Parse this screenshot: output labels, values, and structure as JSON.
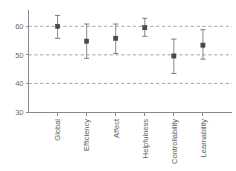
{
  "chart_data": {
    "type": "scatter",
    "title": "",
    "subtitle": "",
    "xlabel": "",
    "ylabel": "",
    "categories": [
      "Global",
      "Efficiency",
      "Affect",
      "Helpfulness",
      "Controllability",
      "Learnability"
    ],
    "values": [
      60.0,
      54.8,
      55.8,
      59.5,
      49.6,
      53.4
    ],
    "error_low": [
      55.8,
      48.8,
      50.5,
      56.5,
      43.5,
      48.5
    ],
    "error_high": [
      63.8,
      60.8,
      60.8,
      62.8,
      55.5,
      58.8
    ],
    "series": [
      {
        "name": "Mean with confidence interval",
        "values": [
          60.0,
          54.8,
          55.8,
          59.5,
          49.6,
          53.4
        ]
      }
    ],
    "ylim": [
      30,
      65
    ],
    "xlim": [
      0,
      7
    ],
    "yticks": [
      30,
      40,
      50,
      60
    ],
    "ytick_labels": [
      "30",
      "40",
      "50",
      "60"
    ],
    "gridlines_y": [
      40,
      50,
      60
    ],
    "grid": true,
    "grid_style": "dashed",
    "legend": false,
    "legend_position": "none",
    "marker": "square",
    "annotations": []
  },
  "axes": {
    "y_ticks": [
      {
        "label": "60",
        "value": 60
      },
      {
        "label": "50",
        "value": 50
      },
      {
        "label": "40",
        "value": 40
      },
      {
        "label": "30",
        "value": 30
      }
    ],
    "x_categories": [
      {
        "label": "Global",
        "index": 1
      },
      {
        "label": "Efficiency",
        "index": 2
      },
      {
        "label": "Affect",
        "index": 3
      },
      {
        "label": "Helpfulness",
        "index": 4
      },
      {
        "label": "Controllability",
        "index": 5
      },
      {
        "label": "Learnability",
        "index": 6
      }
    ]
  },
  "colors": {
    "background": "#ffffff",
    "axis": "#8a8a8a",
    "grid": "#9a9a9a",
    "marker": "#4a4a4a",
    "error_bar": "#7d7d7d",
    "tick_text": "#6a6a6a",
    "category_text": "#5c5c5c"
  }
}
